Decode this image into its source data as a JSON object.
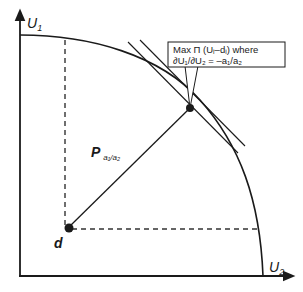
{
  "diagram": {
    "type": "utility-possibility-frontier",
    "axes": {
      "y_label": "U",
      "y_label_sub": "1",
      "x_label": "U",
      "x_label_sub": "2"
    },
    "points": {
      "disagreement": {
        "label": "d"
      },
      "solution_line": {
        "label": "P",
        "label_sub": "a₁/a₂"
      }
    },
    "callout": {
      "line1": "Max Π (Uᵢ–dᵢ) where",
      "line2": "∂U₁/∂U₂ = –a₁/a₂"
    },
    "colors": {
      "stroke": "#1a1a1a",
      "dashed": "#333333",
      "background": "#ffffff"
    }
  }
}
